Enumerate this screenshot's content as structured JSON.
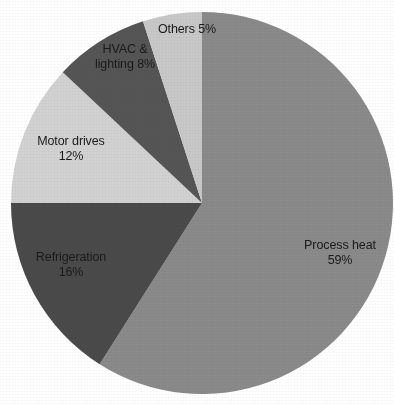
{
  "background_color": "#ffffff",
  "label_text_color": "#1a1a1a",
  "chart_data": {
    "type": "pie",
    "title": "",
    "subtitle": "",
    "xlabel": "",
    "ylabel": "",
    "grid": false,
    "legend_position": "none",
    "labels_position": "inside-slice",
    "units": "%",
    "start_angle_deg": 0,
    "direction": "clockwise",
    "center": {
      "x": 202,
      "y": 203
    },
    "radius": 191,
    "categories": [
      "Process heat",
      "Refrigeration",
      "Motor drives",
      "HVAC & lighting",
      "Others"
    ],
    "values": [
      59,
      16,
      12,
      8,
      5
    ],
    "total": 100,
    "colors": [
      "#8a8a8a",
      "#4a4a4a",
      "#d2d2d2",
      "#555555",
      "#c8c8c8"
    ],
    "slices": [
      {
        "name": "Process heat",
        "value": 59,
        "value_label": "59%",
        "color": "#8a8a8a",
        "start_angle_deg": 0,
        "end_angle_deg": 212.4,
        "label_lines": [
          "Process heat",
          "59%"
        ]
      },
      {
        "name": "Refrigeration",
        "value": 16,
        "value_label": "16%",
        "color": "#4a4a4a",
        "start_angle_deg": 212.4,
        "end_angle_deg": 270.0,
        "label_lines": [
          "Refrigeration",
          "16%"
        ]
      },
      {
        "name": "Motor drives",
        "value": 12,
        "value_label": "12%",
        "color": "#d2d2d2",
        "start_angle_deg": 270.0,
        "end_angle_deg": 313.2,
        "label_lines": [
          "Motor drives",
          "12%"
        ]
      },
      {
        "name": "HVAC & lighting",
        "value": 8,
        "value_label": "8%",
        "color": "#555555",
        "start_angle_deg": 313.2,
        "end_angle_deg": 342.0,
        "label_lines": [
          "HVAC &",
          "lighting 8%"
        ]
      },
      {
        "name": "Others",
        "value": 5,
        "value_label": "5%",
        "color": "#c8c8c8",
        "start_angle_deg": 342.0,
        "end_angle_deg": 360.0,
        "label_lines": [
          "Others 5%",
          ""
        ]
      }
    ]
  }
}
